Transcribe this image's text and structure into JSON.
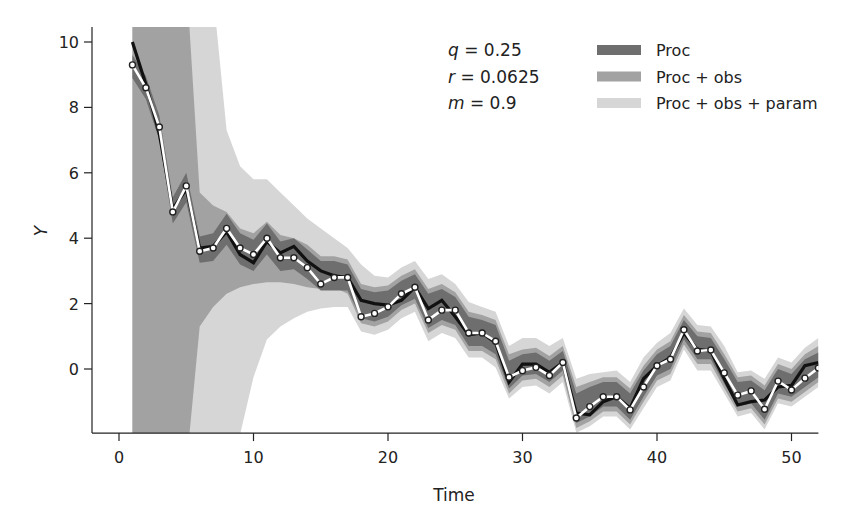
{
  "chart_data": {
    "type": "line",
    "title": "",
    "xlabel": "Time",
    "ylabel": "Y",
    "xlim": [
      -2,
      52
    ],
    "ylim": [
      -1.96,
      10.46
    ],
    "xticks": [
      0,
      10,
      20,
      30,
      40,
      50
    ],
    "yticks": [
      0,
      2,
      4,
      6,
      8,
      10
    ],
    "grid": false,
    "legend_position": "upper right",
    "annotations": [
      {
        "symbol": "q",
        "text": " = 0.25"
      },
      {
        "symbol": "r",
        "text": " = 0.0625"
      },
      {
        "symbol": "m",
        "text": " = 0.9"
      }
    ],
    "legend": [
      {
        "label": "Proc",
        "color": "#6e6e6e"
      },
      {
        "label": "Proc + obs",
        "color": "#a2a2a2"
      },
      {
        "label": "Proc + obs + param",
        "color": "#d6d6d6"
      }
    ],
    "x": [
      1,
      2,
      3,
      4,
      5,
      6,
      7,
      8,
      9,
      10,
      11,
      12,
      13,
      14,
      15,
      16,
      17,
      18,
      19,
      20,
      21,
      22,
      23,
      24,
      25,
      26,
      27,
      28,
      29,
      30,
      31,
      32,
      33,
      34,
      35,
      36,
      37,
      38,
      39,
      40,
      41,
      42,
      43,
      44,
      45,
      46,
      47,
      48,
      49,
      50,
      51,
      52
    ],
    "series": [
      {
        "name": "True state",
        "color": "#111111",
        "values": [
          10.0,
          8.7,
          7.2,
          4.9,
          5.5,
          3.7,
          3.75,
          4.2,
          3.5,
          3.25,
          3.9,
          3.55,
          3.75,
          3.3,
          3.0,
          2.85,
          2.8,
          2.1,
          2.0,
          1.95,
          2.1,
          2.5,
          1.85,
          2.1,
          1.6,
          1.05,
          1.1,
          0.8,
          -0.4,
          0.15,
          0.15,
          -0.1,
          0.2,
          -1.35,
          -1.4,
          -1.0,
          -0.85,
          -1.2,
          -0.3,
          0.1,
          0.35,
          1.1,
          0.6,
          0.55,
          -0.3,
          -1.1,
          -1.0,
          -0.95,
          -0.55,
          -0.5,
          0.1,
          0.2
        ]
      },
      {
        "name": "Estimated state",
        "color": "#ffffff",
        "markers": true,
        "values": [
          9.3,
          8.6,
          7.4,
          4.8,
          5.6,
          3.6,
          3.7,
          4.3,
          3.7,
          3.5,
          4.0,
          3.4,
          3.4,
          3.1,
          2.6,
          2.8,
          2.8,
          1.6,
          1.7,
          1.9,
          2.3,
          2.5,
          1.5,
          1.8,
          1.8,
          1.1,
          1.1,
          0.85,
          -0.25,
          -0.05,
          0.05,
          -0.2,
          0.2,
          -1.5,
          -1.15,
          -0.85,
          -0.85,
          -1.25,
          -0.55,
          0.1,
          0.3,
          1.2,
          0.55,
          0.58,
          -0.12,
          -0.8,
          -0.67,
          -1.23,
          -0.37,
          -0.64,
          -0.28,
          0.03
        ]
      }
    ],
    "bands": [
      {
        "name": "Proc + obs + param",
        "color": "#d6d6d6",
        "upper": [
          12,
          12,
          12,
          12,
          12,
          12,
          11.5,
          7.3,
          6.2,
          5.8,
          5.8,
          5.4,
          5.0,
          4.6,
          4.3,
          4.0,
          3.7,
          3.2,
          2.85,
          2.8,
          3.1,
          3.3,
          2.75,
          2.9,
          2.6,
          2.05,
          1.9,
          1.75,
          0.7,
          0.95,
          0.95,
          0.7,
          0.95,
          -0.3,
          -0.15,
          -0.1,
          -0.05,
          -0.4,
          0.35,
          0.8,
          1.1,
          1.85,
          1.35,
          1.3,
          0.7,
          -0.1,
          -0.05,
          -0.3,
          0.35,
          0.2,
          0.65,
          0.95
        ],
        "lower": [
          -3,
          -3,
          -3,
          -3,
          -3,
          -3,
          -3,
          -3,
          -2.0,
          -0.25,
          0.9,
          1.3,
          1.55,
          1.75,
          1.85,
          1.9,
          1.9,
          1.15,
          1.05,
          1.2,
          1.55,
          1.75,
          0.85,
          1.1,
          0.95,
          0.35,
          0.35,
          0.05,
          -0.9,
          -0.55,
          -0.5,
          -0.75,
          -0.4,
          -1.95,
          -1.75,
          -1.45,
          -1.45,
          -1.85,
          -1.2,
          -0.55,
          -0.35,
          0.6,
          -0.05,
          -0.05,
          -0.75,
          -1.45,
          -1.35,
          -1.85,
          -1.05,
          -1.15,
          -0.85,
          -0.55
        ]
      },
      {
        "name": "Proc + obs",
        "color": "#a2a2a2",
        "upper": [
          12,
          12,
          12,
          12,
          12,
          5.4,
          5.0,
          4.8,
          4.3,
          4.15,
          4.5,
          4.1,
          4.0,
          3.8,
          3.45,
          3.45,
          3.35,
          2.6,
          2.5,
          2.55,
          2.85,
          3.05,
          2.45,
          2.6,
          2.35,
          1.75,
          1.65,
          1.5,
          0.45,
          0.6,
          0.65,
          0.4,
          0.7,
          -0.55,
          -0.4,
          -0.25,
          -0.25,
          -0.6,
          0.1,
          0.6,
          0.85,
          1.65,
          1.15,
          1.1,
          0.45,
          -0.25,
          -0.2,
          -0.5,
          0.15,
          0.0,
          0.45,
          0.7
        ],
        "lower": [
          -3,
          -3,
          -3,
          -3,
          -3,
          1.3,
          1.9,
          2.3,
          2.5,
          2.6,
          2.65,
          2.65,
          2.6,
          2.5,
          2.45,
          2.5,
          2.3,
          1.4,
          1.3,
          1.45,
          1.8,
          2.0,
          1.1,
          1.35,
          1.2,
          0.55,
          0.55,
          0.3,
          -0.75,
          -0.35,
          -0.3,
          -0.55,
          -0.2,
          -1.8,
          -1.6,
          -1.3,
          -1.3,
          -1.7,
          -1.0,
          -0.35,
          -0.15,
          0.75,
          0.15,
          0.15,
          -0.6,
          -1.3,
          -1.2,
          -1.7,
          -0.9,
          -1.0,
          -0.7,
          -0.4
        ]
      },
      {
        "name": "Proc",
        "color": "#6e6e6e",
        "upper": [
          9.6,
          8.95,
          7.75,
          5.25,
          6.0,
          4.05,
          4.15,
          4.75,
          4.15,
          3.95,
          4.45,
          3.9,
          4.0,
          3.65,
          3.3,
          3.3,
          3.2,
          2.45,
          2.35,
          2.4,
          2.7,
          2.9,
          2.3,
          2.45,
          2.2,
          1.6,
          1.5,
          1.35,
          0.25,
          0.45,
          0.5,
          0.25,
          0.55,
          -0.75,
          -0.55,
          -0.4,
          -0.4,
          -0.75,
          -0.05,
          0.45,
          0.7,
          1.5,
          1.0,
          0.95,
          0.3,
          -0.4,
          -0.35,
          -0.65,
          0.0,
          -0.15,
          0.3,
          0.5
        ],
        "lower": [
          8.9,
          8.25,
          7.0,
          4.45,
          5.1,
          3.25,
          3.3,
          3.8,
          3.2,
          3.0,
          3.5,
          3.0,
          3.05,
          2.75,
          2.4,
          2.4,
          2.4,
          1.55,
          1.45,
          1.6,
          1.95,
          2.15,
          1.25,
          1.5,
          1.35,
          0.7,
          0.7,
          0.45,
          -0.6,
          -0.2,
          -0.15,
          -0.4,
          -0.05,
          -1.65,
          -1.45,
          -1.15,
          -1.15,
          -1.55,
          -0.85,
          -0.2,
          0.0,
          0.9,
          0.3,
          0.3,
          -0.45,
          -1.15,
          -1.05,
          -1.55,
          -0.75,
          -0.85,
          -0.55,
          -0.25
        ]
      }
    ]
  }
}
